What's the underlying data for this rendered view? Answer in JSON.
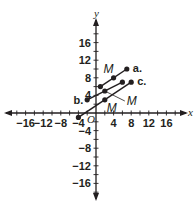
{
  "chart_data": {
    "type": "scatter",
    "title": "",
    "xlabel": "x",
    "ylabel": "y",
    "xlim": [
      -20,
      20
    ],
    "ylim": [
      -20,
      20
    ],
    "grid": false,
    "x_ticks": [
      -16,
      -12,
      -8,
      -4,
      4,
      8,
      12,
      16
    ],
    "y_ticks": [
      16,
      12,
      8,
      4,
      -4,
      -8,
      -12,
      -16
    ],
    "x_tick_labels": [
      "−16",
      "−12",
      "−8",
      "−4",
      "4",
      "8",
      "12",
      "16"
    ],
    "y_tick_labels": [
      "16",
      "12",
      "8",
      "4",
      "−4",
      "−8",
      "−12",
      "−16"
    ],
    "origin_label": "O",
    "series": [
      {
        "name": "a.",
        "points": [
          [
            1,
            6
          ],
          [
            4,
            8
          ],
          [
            7,
            10
          ]
        ],
        "midpoint": [
          4,
          8
        ],
        "midpoint_label": "M"
      },
      {
        "name": "b.",
        "points": [
          [
            -2,
            3
          ],
          [
            2,
            5
          ],
          [
            6,
            7
          ]
        ],
        "midpoint": [
          2,
          5
        ],
        "midpoint_label": "M"
      },
      {
        "name": "c.",
        "points": [
          [
            -4,
            -1
          ],
          [
            2,
            3
          ],
          [
            8,
            7
          ]
        ],
        "midpoint": [
          2,
          3
        ],
        "midpoint_label": "M"
      }
    ],
    "annotations": [
      "a.",
      "b.",
      "c.",
      "M",
      "M",
      "M",
      "O"
    ],
    "color": "#231f20"
  }
}
